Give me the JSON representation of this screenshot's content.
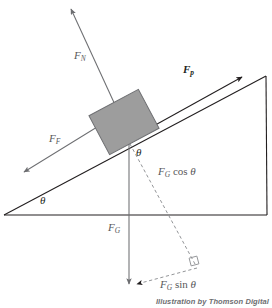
{
  "figure": {
    "type": "physics-free-body-diagram",
    "background_color": "#ffffff",
    "credit": "Illustration by Thomson Digital"
  },
  "colors": {
    "incline_stroke": "#231f20",
    "vector_stroke": "#6d6e71",
    "dashed_stroke": "#939598",
    "block_fill": "#9d9d9d",
    "block_stroke": "#6d6e71",
    "label_gray": "#58585a",
    "label_dark": "#231f20"
  },
  "incline": {
    "name": "inclined-plane-triangle",
    "base_start": [
      4,
      215
    ],
    "base_end": [
      267,
      215
    ],
    "apex": [
      266,
      76
    ],
    "angle_symbol": "θ"
  },
  "block": {
    "name": "block-on-incline",
    "center": [
      124,
      122
    ],
    "width": 56,
    "height": 44,
    "rotation_deg": -28
  },
  "vectors": [
    {
      "id": "normal-force",
      "symbol": "F",
      "subscript": "N",
      "label_pos": [
        77,
        56
      ],
      "bold": false,
      "from": [
        128,
        133
      ],
      "to": [
        70,
        7
      ],
      "description": "Normal force, perpendicular to incline surface, pointing away from plane"
    },
    {
      "id": "applied-force",
      "symbol": "F",
      "subscript": "p",
      "label_pos": [
        186,
        71
      ],
      "bold": true,
      "from": [
        115,
        147
      ],
      "to": [
        243,
        76
      ],
      "description": "Applied force, parallel to incline, pointing up the slope"
    },
    {
      "id": "friction-force",
      "symbol": "F",
      "subscript": "F",
      "label_pos": [
        52,
        139
      ],
      "bold": false,
      "from": [
        128,
        108
      ],
      "to": [
        22,
        173
      ],
      "description": "Friction force, parallel to incline, pointing down the slope"
    },
    {
      "id": "gravity-force",
      "symbol": "F",
      "subscript": "G",
      "label_pos": [
        110,
        228
      ],
      "bold": false,
      "from": [
        129,
        120
      ],
      "to": [
        129,
        285
      ],
      "description": "Gravitational force, vertically downward"
    }
  ],
  "components": [
    {
      "id": "gravity-cosine-component",
      "text_prefix": "F",
      "text_subscript": "G",
      "text_suffix": " cos ",
      "text_theta": "θ",
      "label_pos": [
        162,
        172
      ],
      "from": [
        130,
        144
      ],
      "to": [
        196,
        266
      ],
      "style": "dashed",
      "description": "Component of gravity perpendicular to incline"
    },
    {
      "id": "gravity-sine-component",
      "text_prefix": "F",
      "text_subscript": "G",
      "text_suffix": " sin ",
      "text_theta": "θ",
      "label_pos": [
        163,
        285
      ],
      "from": [
        196,
        266
      ],
      "to": [
        134,
        285
      ],
      "style": "dashed",
      "description": "Component of gravity parallel to incline"
    }
  ],
  "angles": [
    {
      "id": "incline-base-angle",
      "symbol": "θ",
      "label_pos": [
        43,
        200
      ],
      "description": "Angle between incline surface and horizontal base"
    },
    {
      "id": "block-gravity-angle",
      "symbol": "θ",
      "label_pos": [
        139,
        152
      ],
      "description": "Angle between gravity vector and perpendicular to incline"
    }
  ],
  "markers": [
    {
      "id": "right-angle-marker",
      "pos": [
        196,
        266
      ],
      "size": 8,
      "description": "Right angle between cosine and sine components"
    }
  ]
}
